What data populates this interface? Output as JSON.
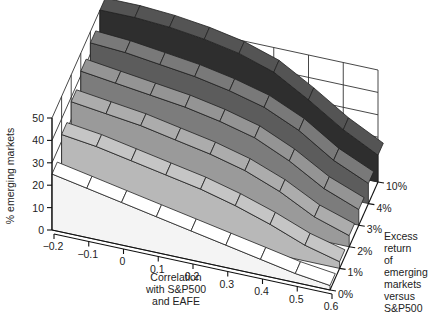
{
  "chart_data": {
    "type": "surface3d",
    "title": "",
    "xlabel": "Correlation with S&P500 and EAFE",
    "xlabel_lines": [
      "Correlation",
      "with S&P500",
      "and EAFE"
    ],
    "ylabel": "Excess return of emerging markets versus S&P500",
    "ylabel_lines": [
      "Excess",
      "return",
      "of",
      "emerging",
      "markets",
      "versus",
      "S&P500"
    ],
    "zlabel": "% emerging markets",
    "x_ticks": [
      "-0.2",
      "-0.1",
      "0",
      "0.1",
      "0.2",
      "0.3",
      "0.4",
      "0.5",
      "0.6"
    ],
    "x": [
      -0.2,
      -0.1,
      0,
      0.1,
      0.2,
      0.3,
      0.4,
      0.5,
      0.6
    ],
    "y_ticks": [
      "0%",
      "1%",
      "2%",
      "3%",
      "4%",
      "10%"
    ],
    "z_ticks": [
      "0",
      "10",
      "20",
      "30",
      "40",
      "50"
    ],
    "zlim": [
      0,
      50
    ],
    "grid": true,
    "series": [
      {
        "name": "0%",
        "values": [
          25,
          22,
          19,
          16,
          13,
          10,
          7,
          4,
          2
        ]
      },
      {
        "name": "1%",
        "values": [
          33,
          31,
          28,
          25,
          22,
          18,
          13,
          7,
          3
        ]
      },
      {
        "name": "2%",
        "values": [
          38,
          36,
          34,
          31,
          28,
          24,
          18,
          10,
          5
        ]
      },
      {
        "name": "3%",
        "values": [
          42,
          40,
          38,
          36,
          33,
          29,
          22,
          13,
          7
        ]
      },
      {
        "name": "4%",
        "values": [
          45,
          44,
          42,
          40,
          37,
          33,
          26,
          16,
          9
        ]
      },
      {
        "name": "10%",
        "values": [
          50,
          50,
          49,
          47,
          44,
          39,
          30,
          20,
          12
        ]
      }
    ],
    "colors": [
      "#f4f4f4",
      "#b8b8b8",
      "#9a9a9a",
      "#7c7c7c",
      "#5c5c5c",
      "#2e2e2e"
    ]
  }
}
